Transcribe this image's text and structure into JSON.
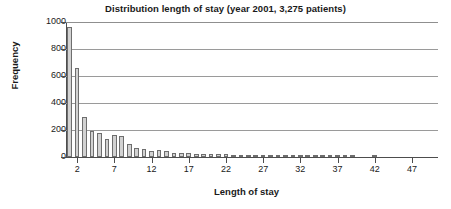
{
  "chart_data": {
    "type": "bar",
    "title": "Distribution length of stay (year 2001, 3,275 patients)",
    "xlabel": "Length of stay",
    "ylabel": "Frequency",
    "ylim": [
      0,
      1000
    ],
    "xlim": [
      1,
      50
    ],
    "yticks": [
      1000,
      800,
      600,
      400,
      200,
      0
    ],
    "ytick_labels": [
      "1000",
      "800",
      "600",
      "400",
      "200",
      "0"
    ],
    "xticks": [
      2,
      7,
      12,
      17,
      22,
      27,
      32,
      37,
      42,
      47
    ],
    "xtick_labels": [
      "2",
      "7",
      "12",
      "17",
      "22",
      "27",
      "32",
      "37",
      "42",
      "47"
    ],
    "grid": true,
    "legend": null,
    "bar_fill_color": "#d2d2d2",
    "bar_edge_color": "#6e6e6e",
    "categories": [
      1,
      2,
      3,
      4,
      5,
      6,
      7,
      8,
      9,
      10,
      11,
      12,
      13,
      14,
      15,
      16,
      17,
      18,
      19,
      20,
      21,
      22,
      23,
      24,
      25,
      26,
      27,
      28,
      29,
      30,
      31,
      32,
      33,
      34,
      35,
      36,
      37,
      38,
      39,
      40,
      41,
      42,
      43,
      44,
      45,
      46,
      47,
      48,
      49,
      50
    ],
    "values": [
      960,
      660,
      300,
      195,
      175,
      130,
      165,
      157,
      100,
      70,
      62,
      48,
      50,
      48,
      30,
      27,
      28,
      26,
      25,
      22,
      20,
      20,
      18,
      17,
      16,
      15,
      14,
      14,
      12,
      12,
      11,
      10,
      9,
      9,
      6,
      4,
      10,
      8,
      3,
      0,
      0,
      12,
      0,
      0,
      0,
      0,
      0,
      0,
      0,
      0
    ]
  }
}
